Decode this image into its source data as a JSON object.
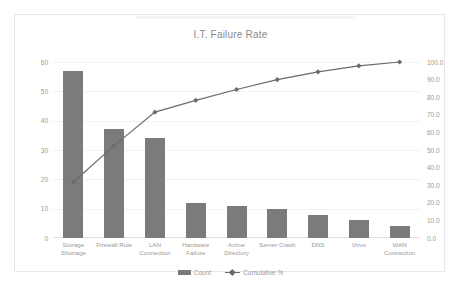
{
  "chart_data": {
    "type": "bar",
    "title": "I.T. Failure Rate",
    "xlabel": "",
    "ylabel": "",
    "grid": true,
    "legend_position": "bottom",
    "categories": [
      "Storage Shortage",
      "Firewall Rule",
      "LAN Connection",
      "Hardware Failure",
      "Active Directory",
      "Server Crash",
      "DNS",
      "Virus",
      "WAN Connection"
    ],
    "series": [
      {
        "name": "Count",
        "type": "bar",
        "axis": "left",
        "color": "#7b7b7b",
        "values": [
          57,
          37,
          34,
          12,
          11,
          10,
          8,
          6,
          4
        ]
      },
      {
        "name": "Cumulative %",
        "type": "line",
        "axis": "right",
        "color": "#6b6b6b",
        "values": [
          31.8,
          52.5,
          71.5,
          78.2,
          84.4,
          90.0,
          94.4,
          97.8,
          100.0
        ]
      }
    ],
    "left_axis": {
      "ticks": [
        "0",
        "10",
        "20",
        "30",
        "40",
        "50",
        "60"
      ],
      "min": 0,
      "max": 60
    },
    "right_axis": {
      "ticks": [
        "0.0",
        "10.0",
        "20.0",
        "30.0",
        "40.0",
        "50.0",
        "60.0",
        "70.0",
        "80.0",
        "90.0",
        "100.0"
      ],
      "min": 0,
      "max": 100
    }
  },
  "legend": {
    "count_label": "Count",
    "cumulative_label": "Cumulative %"
  },
  "colors": {
    "bar": "#7b7b7b",
    "line": "#6b6b6b",
    "grid": "#f2f2f2",
    "text": "#9a9a9a",
    "frame": "#e8e8e8"
  }
}
